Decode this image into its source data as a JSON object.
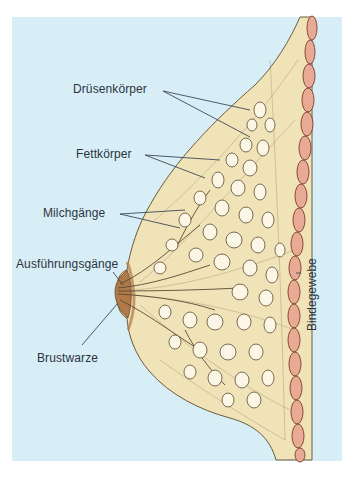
{
  "diagram": {
    "colors": {
      "background": "#ffffff",
      "panel": "#d7eef6",
      "tissue": "#f1e3b8",
      "tissue_outline": "#6b5a3e",
      "connective": "#e9aa95",
      "connective_outline": "#7a3b2a",
      "nipple": "#b07a48",
      "lobule": "#fbf6e6",
      "leader_line": "#3d4a5a",
      "text": "#2b3440"
    },
    "labels": [
      {
        "id": "druesenkoerper",
        "text": "Drüsenkörper",
        "x": 73,
        "y": 82
      },
      {
        "id": "fettkoerper",
        "text": "Fettkörper",
        "x": 76,
        "y": 147
      },
      {
        "id": "milchgaenge",
        "text": "Milchgänge",
        "x": 43,
        "y": 206
      },
      {
        "id": "ausfuehrungsgaenge",
        "text": "Ausführungsgänge",
        "x": 16,
        "y": 257
      },
      {
        "id": "brustwarze",
        "text": "Brustwarze",
        "x": 37,
        "y": 351
      }
    ],
    "vertical_label": {
      "id": "bindegewebe",
      "text": "Bindegewebe",
      "x": 306,
      "y": 330
    }
  }
}
